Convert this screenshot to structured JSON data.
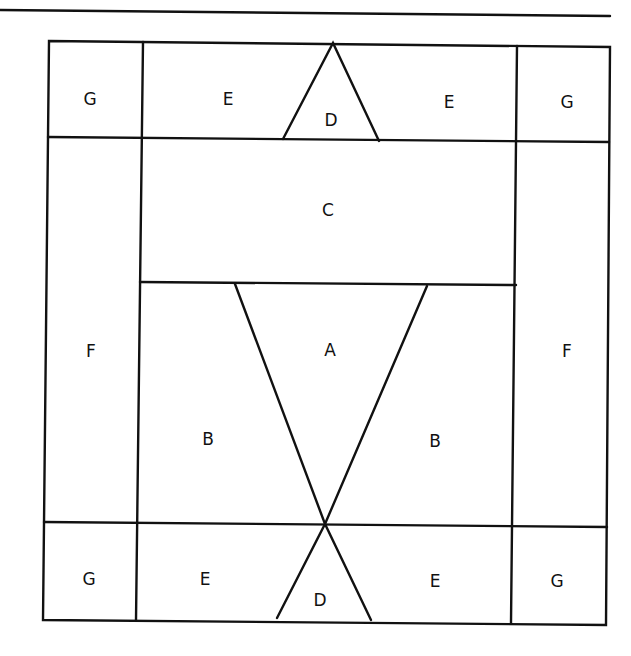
{
  "diagram": {
    "type": "quilt-block-template",
    "labels": {
      "top_left_G": "G",
      "top_left_E": "E",
      "top_D": "D",
      "top_right_E": "E",
      "top_right_G": "G",
      "C": "C",
      "left_F": "F",
      "A": "A",
      "right_F": "F",
      "left_B": "B",
      "right_B": "B",
      "bottom_left_G": "G",
      "bottom_left_E": "E",
      "bottom_D": "D",
      "bottom_right_E": "E",
      "bottom_right_G": "G"
    },
    "colors": {
      "line": "#111111",
      "background": "#ffffff"
    }
  }
}
